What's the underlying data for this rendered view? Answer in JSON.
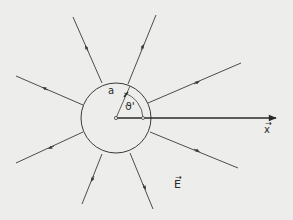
{
  "diagram": {
    "type": "radial-field-sphere",
    "background": "#ededeb",
    "line_color": "#3a3a3a",
    "sphere": {
      "cx": 116,
      "cy": 118,
      "r": 35
    },
    "origin_marker": {
      "cx": 116,
      "cy": 118
    },
    "axis": {
      "x1": 116,
      "y1": 118,
      "x2": 276,
      "y2": 118,
      "label": "x",
      "label_arrow": "→"
    },
    "field_label": {
      "text": "E",
      "arrow": "→"
    },
    "radius_label": "a",
    "angle_label": "ϑ'",
    "field_lines": [
      {
        "name": "upper-left",
        "x1": 102,
        "y1": 83,
        "x2": 73,
        "y2": 17,
        "arrow": [
          86,
          47
        ]
      },
      {
        "name": "upper-right",
        "x1": 128,
        "y1": 84,
        "x2": 156,
        "y2": 15,
        "arrow": [
          143,
          46
        ]
      },
      {
        "name": "right-upper",
        "x1": 148,
        "y1": 103,
        "x2": 241,
        "y2": 63,
        "arrow": [
          198,
          82
        ]
      },
      {
        "name": "left-upper",
        "x1": 83,
        "y1": 105,
        "x2": 16,
        "y2": 76,
        "arrow": [
          44,
          88
        ]
      },
      {
        "name": "left-lower",
        "x1": 83,
        "y1": 132,
        "x2": 16,
        "y2": 163,
        "arrow": [
          50,
          148
        ]
      },
      {
        "name": "right-lower",
        "x1": 150,
        "y1": 132,
        "x2": 238,
        "y2": 168,
        "arrow": [
          198,
          151
        ]
      },
      {
        "name": "lower-left",
        "x1": 102,
        "y1": 154,
        "x2": 82,
        "y2": 204,
        "arrow": [
          92,
          180
        ]
      },
      {
        "name": "lower-right",
        "x1": 130,
        "y1": 153,
        "x2": 153,
        "y2": 209,
        "arrow": [
          145,
          188
        ]
      }
    ]
  }
}
